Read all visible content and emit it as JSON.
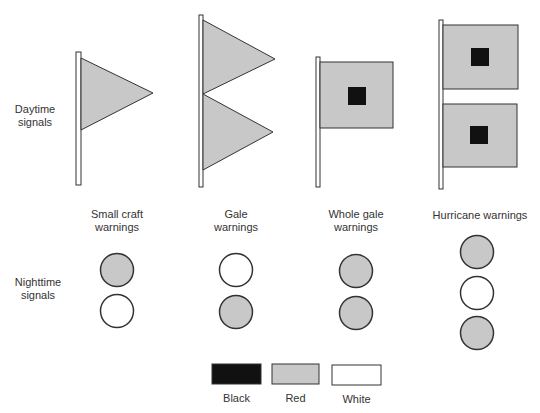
{
  "row_labels": {
    "daytime": [
      "Daytime",
      "signals"
    ],
    "nighttime": [
      "Nighttime",
      "signals"
    ]
  },
  "categories": [
    {
      "name_lines": [
        "Small craft",
        "warnings"
      ],
      "day": "1 red pennant",
      "night": [
        "red",
        "white"
      ]
    },
    {
      "name_lines": [
        "Gale",
        "warnings"
      ],
      "day": "2 red pennants",
      "night": [
        "white",
        "red"
      ]
    },
    {
      "name_lines": [
        "Whole gale",
        "warnings"
      ],
      "day": "1 red flag with black square",
      "night": [
        "red",
        "red"
      ]
    },
    {
      "name_lines": [
        "Hurricane warnings"
      ],
      "day": "2 red flags with black squares",
      "night": [
        "red",
        "white",
        "red"
      ]
    }
  ],
  "legend": [
    {
      "label": "Black",
      "color": "#111111"
    },
    {
      "label": "Red",
      "color": "#c8c8c8"
    },
    {
      "label": "White",
      "color": "#ffffff"
    }
  ]
}
